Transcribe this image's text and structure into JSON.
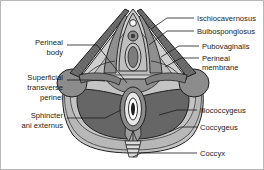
{
  "figure": {
    "type": "anatomical-diagram",
    "style": "grayscale line illustration",
    "background_color": "#ffffff",
    "border_color": "#b9b9b9",
    "leader_line_color": "#1a1a1a",
    "text_color": "#1a1a1a"
  },
  "labels_right": [
    {
      "id": "ischiocavernosus",
      "text": "Ischiocavernosus",
      "x": 196,
      "y": 17
    },
    {
      "id": "bulbospongiosus",
      "text": "Bulbospongiosus",
      "x": 196,
      "y": 30
    },
    {
      "id": "pubovaginalis",
      "text": "Pubovaginalis",
      "x": 201,
      "y": 45
    },
    {
      "id": "perineal-membrane-1",
      "text": "Perineal",
      "x": 201,
      "y": 57
    },
    {
      "id": "perineal-membrane-2",
      "text": "membrane",
      "x": 201,
      "y": 66
    },
    {
      "id": "iliococcygeus",
      "text": "Iliococcygeus",
      "x": 199,
      "y": 109
    },
    {
      "id": "coccygeus",
      "text": "Coccygeus",
      "x": 199,
      "y": 126
    },
    {
      "id": "coccyx",
      "text": "Coccyx",
      "x": 199,
      "y": 152
    }
  ],
  "labels_left": [
    {
      "id": "perineal-body-1",
      "text": "Perineal",
      "x": 62,
      "y": 41
    },
    {
      "id": "perineal-body-2",
      "text": "body",
      "x": 62,
      "y": 51
    },
    {
      "id": "superficial-transverse-perinei-1",
      "text": "Superficial",
      "x": 62,
      "y": 76
    },
    {
      "id": "superficial-transverse-perinei-2",
      "text": "transverse",
      "x": 62,
      "y": 86
    },
    {
      "id": "superficial-transverse-perinei-3",
      "text": "perinei",
      "x": 62,
      "y": 96
    },
    {
      "id": "sphincter-ani-externus-1",
      "text": "Sphincter",
      "x": 62,
      "y": 114
    },
    {
      "id": "sphincter-ani-externus-2",
      "text": "ani externus",
      "x": 62,
      "y": 124
    }
  ],
  "structures": {
    "ischiocavernosus_muscle": {
      "shade": "#6d6d6d",
      "side": "both",
      "shape": "long-diagonal-band"
    },
    "bulbospongiosus_muscle": {
      "shade": "#8a8a8a",
      "side": "both",
      "shape": "paired-lateral-band"
    },
    "urogenital_triangle_field": {
      "shade": "#cfcfcf"
    },
    "perineal_membrane": {
      "shade": "#b4b4b4"
    },
    "ischial_tuberosity": {
      "shade": "#8c8c8c",
      "side": "both",
      "shape": "rounded-mass"
    },
    "iliococcygeus_muscle": {
      "shade": "#6a6a6a",
      "side": "both",
      "shape": "large-wing"
    },
    "coccygeus_muscle": {
      "shade": "#b8b8b8",
      "side": "both"
    },
    "levator_plate": {
      "shade": "#9a9a9a"
    },
    "anal_canal": {
      "shade": "#ffffff",
      "outline": "#1f1f1f"
    },
    "external_anal_sphincter": {
      "shade": "#8f8f8f"
    },
    "coccyx_segments": {
      "shade": "#d8d8d8",
      "count": 4
    },
    "clitoris": {
      "shade": "#f2f2f2",
      "shape": "small-circle"
    },
    "urethral_opening": {
      "shade": "#8f8f8f",
      "shape": "small-ring"
    },
    "vaginal_opening": {
      "shade": "#7a7a7a",
      "shape": "vertical-oval"
    }
  }
}
